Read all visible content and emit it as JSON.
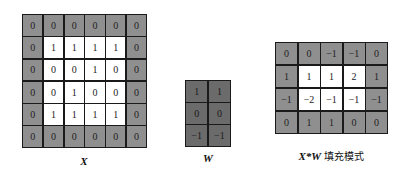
{
  "matrices": {
    "x": {
      "label": "X",
      "shading": [
        [
          "g",
          "g",
          "g",
          "g",
          "g",
          "g"
        ],
        [
          "g",
          "w",
          "w",
          "w",
          "w",
          "g"
        ],
        [
          "g",
          "w",
          "w",
          "w",
          "w",
          "g"
        ],
        [
          "g",
          "w",
          "w",
          "w",
          "w",
          "g"
        ],
        [
          "g",
          "w",
          "w",
          "w",
          "w",
          "g"
        ],
        [
          "g",
          "g",
          "g",
          "g",
          "g",
          "g"
        ]
      ],
      "values": [
        [
          "0",
          "0",
          "0",
          "0",
          "0",
          "0"
        ],
        [
          "0",
          "1",
          "1",
          "1",
          "1",
          "0"
        ],
        [
          "0",
          "0",
          "0",
          "1",
          "0",
          "0"
        ],
        [
          "0",
          "0",
          "1",
          "0",
          "0",
          "0"
        ],
        [
          "0",
          "1",
          "1",
          "1",
          "1",
          "0"
        ],
        [
          "0",
          "0",
          "0",
          "0",
          "0",
          "0"
        ]
      ]
    },
    "w": {
      "label": "W",
      "shading": [
        [
          "d",
          "d"
        ],
        [
          "d",
          "d"
        ],
        [
          "d",
          "d"
        ]
      ],
      "values": [
        [
          "1",
          "1"
        ],
        [
          "0",
          "0"
        ],
        [
          "−1",
          "−1"
        ]
      ]
    },
    "result": {
      "label_math": "X*W",
      "label_text": "填充模式",
      "shading": [
        [
          "g",
          "g",
          "g",
          "g",
          "g"
        ],
        [
          "g",
          "w",
          "w",
          "w",
          "g"
        ],
        [
          "g",
          "w",
          "w",
          "w",
          "g"
        ],
        [
          "g",
          "g",
          "g",
          "g",
          "g"
        ]
      ],
      "values": [
        [
          "0",
          "0",
          "−1",
          "−1",
          "0"
        ],
        [
          "1",
          "1",
          "1",
          "2",
          "1"
        ],
        [
          "−1",
          "−2",
          "−1",
          "−1",
          "−1"
        ],
        [
          "0",
          "1",
          "1",
          "0",
          "0"
        ]
      ]
    }
  },
  "colors": {
    "padding_gray": "#8f8f8f",
    "inner_white": "#ffffff",
    "kernel_gray": "#6b6b6b",
    "border": "#1a1a1a"
  }
}
